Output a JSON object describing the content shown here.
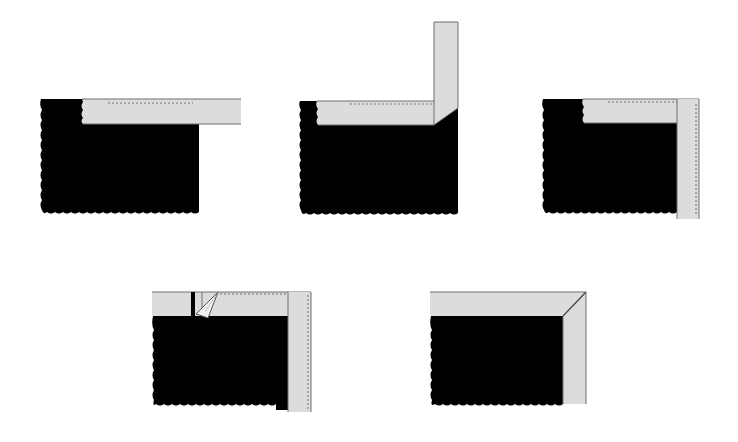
{
  "diagram": {
    "title": "",
    "colors": {
      "background": "#ffffff",
      "panel": "#000000",
      "tape": "#dcdcdc",
      "tape_edge": "#6e6e6e",
      "stitch": "#707070"
    },
    "steps": [
      {
        "id": 1,
        "label": "Tape laid along top edge, extending past corner"
      },
      {
        "id": 2,
        "label": "Tape folded upward at corner with 45° fold"
      },
      {
        "id": 3,
        "label": "Tape folded down along right edge"
      },
      {
        "id": 4,
        "label": "Corner fold tucked with stitching along both edges"
      },
      {
        "id": 5,
        "label": "Finished mitered corner"
      }
    ]
  }
}
